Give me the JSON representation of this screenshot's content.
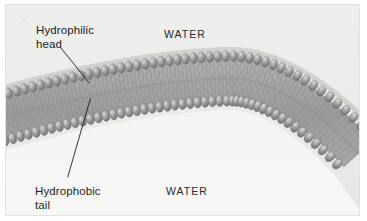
{
  "figure": {
    "background_color": "#f3f3f1",
    "border_color": "#e2e2e0",
    "width": 367,
    "height": 221
  },
  "labels": {
    "hydrophilic": "Hydrophilic\nhead",
    "hydrophobic": "Hydrophobic\ntail",
    "water_top": "WATER",
    "water_bottom": "WATER"
  },
  "leader_lines": {
    "hydrophilic": {
      "x1": 60,
      "y1": 47,
      "x2": 89,
      "y2": 83
    },
    "hydrophobic": {
      "x1": 67,
      "y1": 178,
      "x2": 90,
      "y2": 98
    },
    "color": "#1d1d1d"
  },
  "membrane": {
    "type": "phospholipid-bilayer",
    "description": "Curved lipid bilayer arching upward, with spherical hydrophilic heads facing the water on both surfaces and hydrophobic tails in the interior.",
    "leaflets": 2,
    "head_count_per_leaflet": 46,
    "colors": {
      "head_fill": "#9a9a9a",
      "head_highlight": "#d3d3d3",
      "head_shadow": "#6f6f70",
      "tail_line": "#8f8f90",
      "interior": "#a3a3a3",
      "water_top": "#ececea",
      "water_bottom": "#f6f6f4"
    },
    "geometry": {
      "apex_x": 232,
      "apex_y": 50,
      "left_edge_y": 92,
      "right_edge_y": 88,
      "thickness": 48
    }
  }
}
